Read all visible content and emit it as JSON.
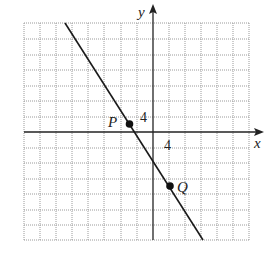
{
  "figure": {
    "axes": {
      "x_label": "x",
      "y_label": "y",
      "x_tick_label": "4",
      "y_tick_label": "4"
    },
    "grid": {
      "columns_left_of_y_axis": 8,
      "columns_right_of_y_axis": 6,
      "rows_above_x_axis": 7,
      "rows_below_x_axis": 7,
      "line_color": "#9a9a9a",
      "line_style": "dotted"
    },
    "points": [
      {
        "label": "P",
        "grid_x": -1.5,
        "grid_y": 0.5
      },
      {
        "label": "Q",
        "grid_x": 1,
        "grid_y": -3.5
      }
    ],
    "line": {
      "description": "straight line through P and Q with negative slope",
      "color": "#1a1a1a"
    }
  }
}
